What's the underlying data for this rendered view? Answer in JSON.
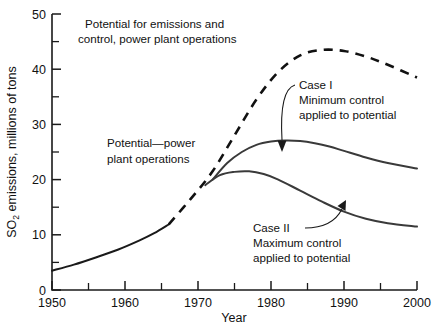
{
  "chart_data": {
    "type": "line",
    "title": "Potential for emissions and control, power plant operations",
    "xlabel": "Year",
    "ylabel": "SO2 emissions, millions of tons",
    "ylabel_prefix": "SO",
    "ylabel_subscript": "2",
    "ylabel_suffix": " emissions, millions of tons",
    "xlim": [
      1950,
      2000
    ],
    "ylim": [
      0,
      50
    ],
    "x_ticks_major": [
      1950,
      1960,
      1970,
      1980,
      1990,
      2000
    ],
    "x_ticks_major_labels": [
      "1950",
      "1960",
      "1970",
      "1980",
      "1990",
      "2000"
    ],
    "x_ticks_minor": [
      1955,
      1965,
      1975,
      1985,
      1995
    ],
    "y_ticks_major": [
      0,
      10,
      20,
      30,
      40,
      50
    ],
    "y_ticks_major_labels": [
      "0",
      "10",
      "20",
      "30",
      "40",
      "50"
    ],
    "y_ticks_minor": [
      5,
      15,
      25,
      35,
      45
    ],
    "grid": false,
    "legend": "none",
    "series": [
      {
        "name": "Historical emissions",
        "style": "solid",
        "x": [
          1950,
          1953,
          1956,
          1959,
          1962,
          1964,
          1966
        ],
        "values": [
          3.5,
          4.6,
          5.9,
          7.3,
          9.0,
          10.3,
          11.9
        ]
      },
      {
        "name": "Potential - power plant operations",
        "style": "dashed",
        "x": [
          1966,
          1969,
          1972,
          1975,
          1978,
          1981,
          1984,
          1987,
          1990,
          1993,
          1996,
          2000
        ],
        "values": [
          11.9,
          16.5,
          21.5,
          28.0,
          34.5,
          39.5,
          42.5,
          43.5,
          43.3,
          42.3,
          40.8,
          38.5
        ]
      },
      {
        "name": "Case I - Minimum control applied to potential",
        "style": "solid",
        "x": [
          1972,
          1974,
          1976,
          1978,
          1980,
          1982,
          1984,
          1986,
          1988,
          1990,
          1993,
          1996,
          2000
        ],
        "values": [
          20.0,
          23.0,
          25.0,
          26.3,
          26.9,
          27.1,
          27.0,
          26.6,
          26.0,
          25.2,
          24.0,
          23.0,
          22.0
        ]
      },
      {
        "name": "Case II - Maximum control applied to potential",
        "style": "solid",
        "x": [
          1971,
          1973,
          1975,
          1977,
          1979,
          1981,
          1984,
          1987,
          1990,
          1993,
          1996,
          2000
        ],
        "values": [
          19.0,
          20.8,
          21.4,
          21.5,
          21.0,
          20.0,
          18.0,
          16.0,
          14.2,
          12.9,
          12.1,
          11.5
        ]
      }
    ],
    "annotations": [
      {
        "name": "title-annotation",
        "lines": [
          "Potential for emissions and",
          "control, power plant operations"
        ]
      },
      {
        "name": "potential-annotation",
        "lines": [
          "Potential—power",
          "plant operations"
        ]
      },
      {
        "name": "case-1-annotation",
        "lines": [
          "Case I",
          "Minimum control",
          "applied to potential"
        ]
      },
      {
        "name": "case-2-annotation",
        "lines": [
          "Case II",
          "Maximum control",
          "applied to potential"
        ]
      }
    ]
  }
}
